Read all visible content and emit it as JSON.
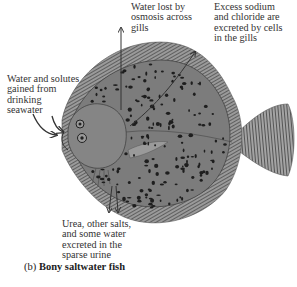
{
  "figure": {
    "labels": {
      "osmosis": "Water lost by\nosmosis across\ngills",
      "sodium": "Excess sodium\nand chloride are\nexcreted by cells\nin the gills",
      "drinking": "Water and solutes\ngained from\ndrinking\nseawater",
      "urine": "Urea, other salts,\nand some water\nexcreted in the\nsparse urine"
    },
    "caption": {
      "letter": "(b)",
      "title": "Bony saltwater fish"
    },
    "colors": {
      "body": "#7c7c7c",
      "fin": "#8e8e8e",
      "spots": "#1e1e1e",
      "arrow": "#333333"
    }
  }
}
